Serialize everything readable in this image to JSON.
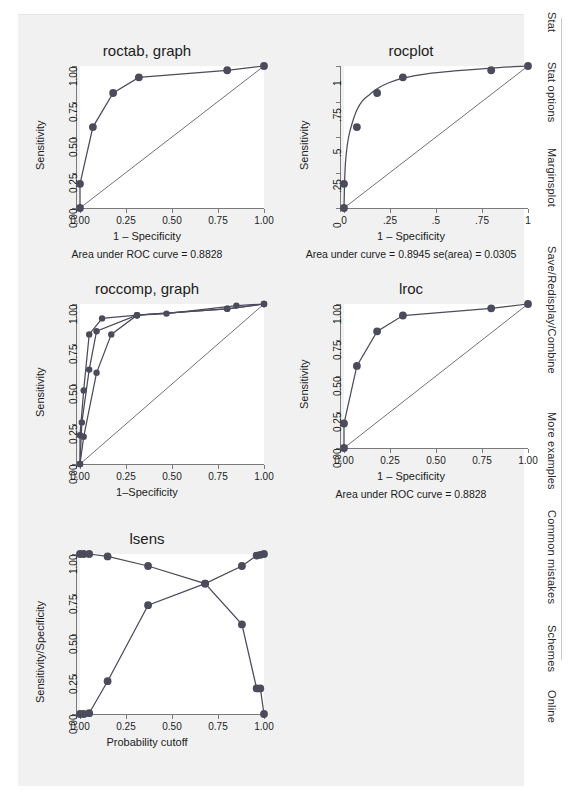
{
  "sidebar": {
    "items": [
      {
        "label": "Stat"
      },
      {
        "label": "Stat options"
      },
      {
        "label": "Marginsplot"
      },
      {
        "label": "Save/Redisplay/Combine"
      },
      {
        "label": "More examples"
      },
      {
        "label": "Common mistakes"
      },
      {
        "label": "Schemes"
      },
      {
        "label": "Online"
      }
    ]
  },
  "chart_data": [
    {
      "type": "line",
      "title": "roctab, graph",
      "xlabel": "1 – Specificity",
      "ylabel": "Sensitivity",
      "note": "Area under ROC curve = 0.8828",
      "xlim": [
        0,
        1
      ],
      "ylim": [
        0,
        1
      ],
      "xticks": [
        0,
        0.25,
        0.5,
        0.75,
        1
      ],
      "xticklabels": [
        "0.00",
        "0.25",
        "0.50",
        "0.75",
        "1.00"
      ],
      "yticks": [
        0,
        0.25,
        0.5,
        0.75,
        1
      ],
      "yticklabels": [
        "0.00",
        "0.25",
        "0.50",
        "0.75",
        "1.00"
      ],
      "grid": false,
      "reference_line": {
        "x": [
          0,
          1
        ],
        "y": [
          0,
          1
        ]
      },
      "series": [
        {
          "name": "ROC",
          "markers": true,
          "x": [
            0,
            0,
            0.07,
            0.18,
            0.32,
            0.8,
            1.0
          ],
          "y": [
            0,
            0.17,
            0.57,
            0.81,
            0.92,
            0.97,
            1.0
          ]
        }
      ]
    },
    {
      "type": "line",
      "title": "rocplot",
      "xlabel": "1 – Specificity",
      "ylabel": "Sensitivity",
      "note": "Area under curve = 0.8945  se(area) = 0.0305",
      "xlim": [
        0,
        1
      ],
      "ylim": [
        0,
        1
      ],
      "xticks": [
        0,
        0.25,
        0.5,
        0.75,
        1
      ],
      "xticklabels": [
        "0",
        ".25",
        ".5",
        ".75",
        "1"
      ],
      "yticks": [
        0,
        0.25,
        0.5,
        0.75,
        1
      ],
      "yticklabels": [
        "0",
        ".25",
        ".5",
        ".75",
        "1"
      ],
      "grid": false,
      "reference_line": {
        "x": [
          0,
          1
        ],
        "y": [
          0,
          1
        ]
      },
      "series": [
        {
          "name": "Binormal fit",
          "markers": false,
          "smooth": true,
          "x": [
            0,
            0.005,
            0.012,
            0.025,
            0.045,
            0.07,
            0.1,
            0.14,
            0.18,
            0.24,
            0.32,
            0.45,
            0.6,
            0.8,
            1.0
          ],
          "y": [
            0,
            0.25,
            0.38,
            0.5,
            0.6,
            0.69,
            0.755,
            0.8,
            0.84,
            0.88,
            0.915,
            0.945,
            0.965,
            0.985,
            1.0
          ]
        },
        {
          "name": "Empirical points",
          "markers": true,
          "pointsonly": true,
          "x": [
            0,
            0,
            0.07,
            0.18,
            0.32,
            0.8,
            1.0
          ],
          "y": [
            0,
            0.17,
            0.57,
            0.81,
            0.92,
            0.97,
            1.0
          ]
        }
      ]
    },
    {
      "type": "line",
      "title": "roccomp, graph",
      "xlabel": "1–Specificity",
      "ylabel": "Sensitivity",
      "note": "",
      "xlim": [
        0,
        1
      ],
      "ylim": [
        0,
        1
      ],
      "xticks": [
        0,
        0.25,
        0.5,
        0.75,
        1
      ],
      "xticklabels": [
        "0.00",
        "0.25",
        "0.50",
        "0.75",
        "1.00"
      ],
      "yticks": [
        0,
        0.25,
        0.5,
        0.75,
        1
      ],
      "yticklabels": [
        "0.00",
        "0.25",
        "0.50",
        "0.75",
        "1.00"
      ],
      "grid": false,
      "reference_line": {
        "x": [
          0,
          1
        ],
        "y": [
          0,
          1
        ]
      },
      "series": [
        {
          "name": "Curve 1",
          "markers": true,
          "x": [
            0,
            0,
            0.02,
            0.05,
            0.12,
            0.31,
            0.8,
            1.0
          ],
          "y": [
            0,
            0.18,
            0.46,
            0.81,
            0.91,
            0.93,
            0.97,
            1.0
          ]
        },
        {
          "name": "Curve 2",
          "markers": true,
          "x": [
            0,
            0.01,
            0.05,
            0.09,
            0.31,
            0.47,
            0.85,
            1.0
          ],
          "y": [
            0,
            0.26,
            0.59,
            0.83,
            0.93,
            0.94,
            0.99,
            1.0
          ]
        },
        {
          "name": "Curve 3",
          "markers": true,
          "x": [
            0,
            0.02,
            0.09,
            0.17,
            0.31,
            0.8,
            1.0
          ],
          "y": [
            0,
            0.17,
            0.57,
            0.81,
            0.93,
            0.97,
            1.0
          ]
        }
      ]
    },
    {
      "type": "line",
      "title": "lroc",
      "xlabel": "1 – Specificity",
      "ylabel": "Sensitivity",
      "note": "Area under ROC curve = 0.8828",
      "xlim": [
        0,
        1
      ],
      "ylim": [
        0,
        1
      ],
      "xticks": [
        0,
        0.25,
        0.5,
        0.75,
        1
      ],
      "xticklabels": [
        "0.00",
        "0.25",
        "0.50",
        "0.75",
        "1.00"
      ],
      "yticks": [
        0,
        0.25,
        0.5,
        0.75,
        1
      ],
      "yticklabels": [
        "0.00",
        "0.25",
        "0.50",
        "0.75",
        "1.00"
      ],
      "grid": false,
      "reference_line": {
        "x": [
          0,
          1
        ],
        "y": [
          0,
          1
        ]
      },
      "series": [
        {
          "name": "ROC",
          "markers": true,
          "x": [
            0,
            0,
            0.07,
            0.18,
            0.32,
            0.8,
            1.0
          ],
          "y": [
            0,
            0.17,
            0.57,
            0.81,
            0.92,
            0.97,
            1.0
          ]
        }
      ]
    },
    {
      "type": "line",
      "title": "lsens",
      "xlabel": "Probability cutoff",
      "ylabel": "Sensitivity/Specificity",
      "note": "",
      "xlim": [
        0,
        1
      ],
      "ylim": [
        0,
        1
      ],
      "xticks": [
        0,
        0.25,
        0.5,
        0.75,
        1
      ],
      "xticklabels": [
        "0.00",
        "0.25",
        "0.50",
        "0.75",
        "1.00"
      ],
      "yticks": [
        0,
        0.25,
        0.5,
        0.75,
        1
      ],
      "yticklabels": [
        "0.00",
        "0.25",
        "0.50",
        "0.75",
        "1.00"
      ],
      "grid": false,
      "series": [
        {
          "name": "Sensitivity",
          "markers": true,
          "x": [
            0,
            0.02,
            0.05,
            0.15,
            0.37,
            0.68,
            0.88,
            0.96,
            0.98,
            1.0
          ],
          "y": [
            1.0,
            1.0,
            1.0,
            0.985,
            0.925,
            0.815,
            0.56,
            0.16,
            0.16,
            0.0
          ]
        },
        {
          "name": "Specificity",
          "markers": true,
          "x": [
            0,
            0.02,
            0.05,
            0.15,
            0.37,
            0.68,
            0.88,
            0.96,
            0.98,
            1.0
          ],
          "y": [
            0.0,
            0.0,
            0.005,
            0.205,
            0.68,
            0.815,
            0.925,
            0.99,
            0.995,
            1.0
          ]
        }
      ]
    }
  ]
}
